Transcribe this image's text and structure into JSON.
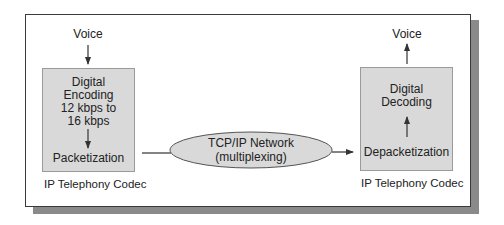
{
  "diagram": {
    "left_codec": {
      "input_label": "Voice",
      "encoding_lines": [
        "Digital",
        "Encoding",
        "12 kbps to",
        "16 kbps"
      ],
      "packetization_label": "Packetization",
      "caption": "IP Telephony Codec"
    },
    "network": {
      "line1": "TCP/IP Network",
      "line2": "(multiplexing)"
    },
    "right_codec": {
      "output_label": "Voice",
      "decoding_lines": [
        "Digital",
        "Decoding"
      ],
      "depacketization_label": "Depacketization",
      "caption": "IP Telephony Codec"
    },
    "colors": {
      "box_fill": "#d9d9d9",
      "ellipse_fill": "#d9d9d9",
      "shadow": "#8a8a8a",
      "stroke": "#333333"
    }
  }
}
